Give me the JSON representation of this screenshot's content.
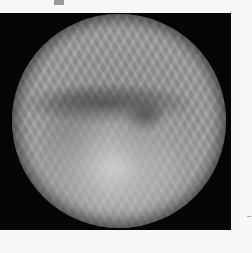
{
  "image": {
    "description": "Grayscale circular radiographic-style image on black square background",
    "colors": {
      "page_background": "#f7f7f7",
      "frame_background": "#050505",
      "marker": "#9a9a9a"
    }
  }
}
